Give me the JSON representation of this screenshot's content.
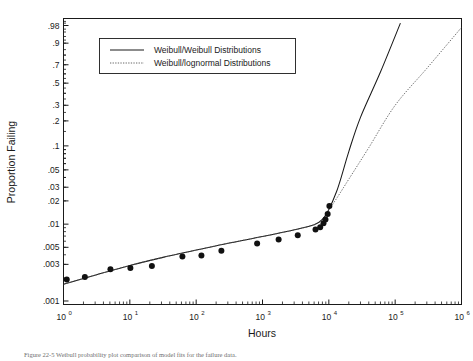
{
  "chart_data": {
    "type": "line",
    "title": "",
    "xlabel": "Hours",
    "ylabel": "Proportion Failing",
    "xscale": "log10",
    "yscale": "weibull-probability",
    "xlim": [
      1,
      1000000
    ],
    "ylim": [
      0.001,
      0.99
    ],
    "grid": false,
    "legend_position": "top-center",
    "x_tick_labels": [
      "10",
      "10",
      "10",
      "10",
      "10",
      "10",
      "10"
    ],
    "x_tick_exponents": [
      "0",
      "1",
      "2",
      "3",
      "4",
      "5",
      "6"
    ],
    "x_tick_values": [
      1,
      10,
      100,
      1000,
      10000,
      100000,
      1000000
    ],
    "y_tick_labels": [
      ".98",
      ".9",
      ".7",
      ".5",
      ".3",
      ".2",
      ".1",
      ".05",
      ".03",
      ".02",
      ".01",
      ".005",
      ".003",
      ".001"
    ],
    "y_tick_values": [
      0.98,
      0.9,
      0.7,
      0.5,
      0.3,
      0.2,
      0.1,
      0.05,
      0.03,
      0.02,
      0.01,
      0.005,
      0.003,
      0.001
    ],
    "series": [
      {
        "name": "Weibull/Weibull Distributions",
        "style": "solid",
        "color": "#1a1a1a",
        "x": [
          1,
          3.16,
          10,
          31.6,
          100,
          316,
          1000,
          3160,
          6000,
          8000,
          10000,
          13000,
          16000,
          20000,
          30000,
          60000,
          120000
        ],
        "y": [
          0.00165,
          0.0022,
          0.0029,
          0.0037,
          0.0046,
          0.0057,
          0.0069,
          0.0085,
          0.0098,
          0.0115,
          0.0155,
          0.026,
          0.045,
          0.085,
          0.22,
          0.62,
          0.985
        ]
      },
      {
        "name": "Weibull/lognormal Distributions",
        "style": "dotted",
        "color": "#555555",
        "x": [
          1,
          3.16,
          10,
          31.6,
          100,
          316,
          1000,
          3160,
          6000,
          8000,
          10000,
          14000,
          20000,
          40000,
          100000,
          300000,
          1000000
        ],
        "y": [
          0.00165,
          0.0022,
          0.0029,
          0.0037,
          0.0046,
          0.0057,
          0.0069,
          0.0085,
          0.0098,
          0.0115,
          0.0152,
          0.0235,
          0.038,
          0.095,
          0.3,
          0.66,
          0.975
        ]
      }
    ],
    "points": {
      "name": "Observed failures",
      "marker": "filled-circle",
      "x": [
        1.12,
        2.1,
        5.1,
        10.2,
        21.5,
        62,
        120,
        240,
        830,
        1750,
        3400,
        6300,
        7400,
        8300,
        8900,
        9600,
        10200
      ],
      "y": [
        0.0019,
        0.00205,
        0.0026,
        0.0027,
        0.00285,
        0.0038,
        0.0039,
        0.0045,
        0.0056,
        0.0063,
        0.0072,
        0.0085,
        0.0091,
        0.0103,
        0.0115,
        0.0135,
        0.0172
      ]
    }
  },
  "legend": {
    "entries": [
      {
        "label": "Weibull/Weibull Distributions",
        "style": "solid"
      },
      {
        "label": "Weibull/lognormal Distributions",
        "style": "dotted"
      }
    ]
  },
  "axes": {
    "x_title": "Hours",
    "y_title": "Proportion Failing"
  },
  "caption": {
    "text": "Figure 22-5   Weibull probability plot comparison of model fits for the failure data."
  }
}
